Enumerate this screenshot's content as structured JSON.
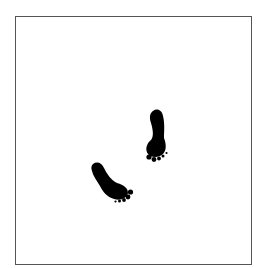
{
  "image": {
    "description": "Two black footprints walking diagonally inside a thin gray square frame",
    "icons": [
      "footprint-icon",
      "footprint-icon"
    ],
    "colors": {
      "background": "#ffffff",
      "frame": "#555555",
      "footprint": "#000000"
    }
  }
}
